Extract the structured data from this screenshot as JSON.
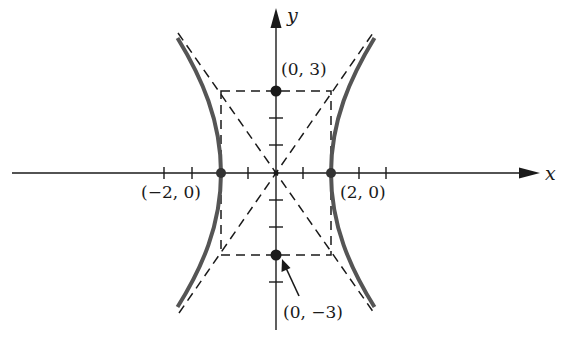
{
  "figure": {
    "type": "hyperbola",
    "equation_form": "x^2/4 - y^2/9 = 1",
    "axes": {
      "x_label": "x",
      "y_label": "y"
    },
    "points": [
      {
        "id": "vertex-left",
        "label": "(−2, 0)",
        "x": -2,
        "y": 0
      },
      {
        "id": "vertex-right",
        "label": "(2, 0)",
        "x": 2,
        "y": 0
      },
      {
        "id": "co-vertex-top",
        "label": "(0, 3)",
        "x": 0,
        "y": 3
      },
      {
        "id": "co-vertex-bottom",
        "label": "(0, −3)",
        "x": 0,
        "y": -3
      }
    ],
    "asymptotes": [
      "y = 3x/2",
      "y = -3x/2"
    ],
    "fundamental_rectangle": {
      "x": [
        -2,
        2
      ],
      "y": [
        -3,
        3
      ]
    },
    "colors": {
      "curve": "#555555",
      "axis": "#1a1a1a",
      "dashed": "#1a1a1a"
    }
  },
  "labels": {
    "x_axis": "x",
    "y_axis": "y",
    "top": "(0, 3)",
    "bottom": "(0, −3)",
    "left": "(−2, 0)",
    "right": "(2, 0)"
  }
}
